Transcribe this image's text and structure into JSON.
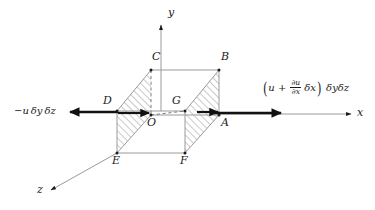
{
  "figure": {
    "type": "3d-control-volume-diagram",
    "background_color": "#ffffff",
    "line_color": "#8a8a8a",
    "ink_color": "#1b1b1b",
    "hatch_color": "#7a7a7a"
  },
  "axes": [
    {
      "id": "y",
      "label": "y",
      "direction": "up",
      "label_x": 168,
      "label_y": 8,
      "tip_x": 161,
      "tip_y": 24,
      "tail_x": 161,
      "tail_y": 111
    },
    {
      "id": "x",
      "label": "x",
      "direction": "right",
      "label_x": 357,
      "label_y": 108,
      "tip_x": 352,
      "tip_y": 114,
      "tail_x": 219,
      "tail_y": 114
    },
    {
      "id": "z",
      "label": "z",
      "direction": "down-left",
      "label_x": 38,
      "label_y": 185,
      "tip_x": 50,
      "tip_y": 191,
      "tail_x": 117,
      "tail_y": 153
    }
  ],
  "vertices": [
    {
      "id": "A",
      "label": "A",
      "x": 219,
      "y": 115,
      "label_x": 221,
      "label_y": 119,
      "dot": true
    },
    {
      "id": "B",
      "label": "B",
      "x": 219,
      "y": 70,
      "label_x": 221,
      "label_y": 53,
      "dot": true
    },
    {
      "id": "C",
      "label": "C",
      "x": 151,
      "y": 70,
      "label_x": 153,
      "label_y": 53,
      "dot": true
    },
    {
      "id": "D",
      "label": "D",
      "x": 117,
      "y": 111,
      "label_x": 104,
      "label_y": 96,
      "dot": true
    },
    {
      "id": "E",
      "label": "E",
      "x": 117,
      "y": 153,
      "label_x": 113,
      "label_y": 157,
      "dot": true
    },
    {
      "id": "F",
      "label": "F",
      "x": 185,
      "y": 153,
      "label_x": 181,
      "label_y": 157,
      "dot": true
    },
    {
      "id": "G",
      "label": "G",
      "x": 185,
      "y": 111,
      "label_x": 173,
      "label_y": 96,
      "dot": true
    },
    {
      "id": "O",
      "label": "O",
      "x": 151,
      "y": 115,
      "label_x": 148,
      "label_y": 119,
      "dot": true
    }
  ],
  "faces": [
    {
      "id": "left-face",
      "name": "DCOE",
      "hatched": true,
      "points": "117,111 151,70 151,115 117,153"
    },
    {
      "id": "right-face",
      "name": "GBAF",
      "hatched": true,
      "points": "185,111 219,70 219,115 185,153"
    },
    {
      "id": "top-face",
      "name": "DCBG",
      "hatched": false,
      "points": "117,111 151,70 219,70 185,111"
    },
    {
      "id": "front-face",
      "name": "OABF",
      "hatched": false,
      "points": "117,111 185,111 185,153 117,153"
    }
  ],
  "force_arrows": [
    {
      "id": "inflow-arrow",
      "direction": "left",
      "from_x": 118,
      "from_y": 112,
      "to_x": 68,
      "to_y": 112,
      "label_text": "-u δy δz",
      "label_x": 14,
      "label_y": 107
    },
    {
      "id": "inflow-arrow-short",
      "direction": "right",
      "from_x": 118,
      "from_y": 113,
      "to_x": 151,
      "to_y": 113,
      "label_text": "",
      "label_x": 0,
      "label_y": 0
    },
    {
      "id": "outflow-arrow",
      "direction": "right",
      "from_x": 210,
      "from_y": 113,
      "to_x": 283,
      "to_y": 113,
      "label_text": "(u + ∂u/∂x δx) δyδz",
      "label_x": 262,
      "label_y": 80
    },
    {
      "id": "outflow-arrow-inner",
      "direction": "right",
      "from_x": 196,
      "from_y": 112,
      "to_x": 219,
      "to_y": 112,
      "label_text": "",
      "label_x": 0,
      "label_y": 0
    }
  ],
  "labels": {
    "axis_y": "y",
    "axis_x": "x",
    "axis_z": "z",
    "vertex_a": "A",
    "vertex_b": "B",
    "vertex_c": "C",
    "vertex_d": "D",
    "vertex_e": "E",
    "vertex_f": "F",
    "vertex_g": "G",
    "vertex_o": "O",
    "left_force": "−u δy δz",
    "left_force_minus": "−",
    "left_force_u": "u",
    "left_force_dy": "δy",
    "left_force_dz": "δz",
    "right_force": "(u + ∂u/∂x δx) δyδz",
    "right_force_paren_open": "(",
    "right_force_paren_close": ")",
    "right_force_u": "u",
    "right_force_plus": "+",
    "right_force_frac_num": "∂u",
    "right_force_frac_den": "∂x",
    "right_force_dx": "δx",
    "right_force_dy": "δy",
    "right_force_dz": "δz"
  }
}
